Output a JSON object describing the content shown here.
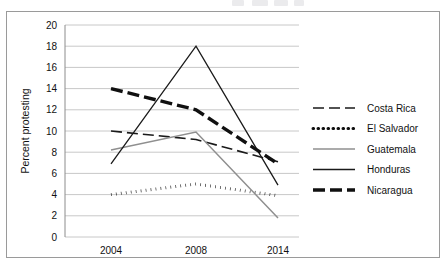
{
  "figure": {
    "border_color": "#9a9a9a",
    "background": "#ffffff"
  },
  "chart_data": {
    "type": "line",
    "title": "",
    "xlabel": "",
    "ylabel": "Percent protesting",
    "x": [
      2004,
      2008,
      2014
    ],
    "xtick_labels": [
      "2004",
      "2008",
      "2014"
    ],
    "ytick_labels": [
      "0",
      "2",
      "4",
      "6",
      "8",
      "10",
      "12",
      "14",
      "16",
      "18",
      "20"
    ],
    "ytick_values": [
      0,
      2,
      4,
      6,
      8,
      10,
      12,
      14,
      16,
      18,
      20
    ],
    "ylim": [
      0,
      20
    ],
    "grid": "horizontal",
    "legend_position": "right",
    "series": [
      {
        "name": "Costa Rica",
        "values": [
          10.0,
          9.2,
          7.1
        ],
        "color": "#1a1a1a",
        "width": 1.6,
        "dash": "11,5",
        "legend_key": "dash-long"
      },
      {
        "name": "El Salvador",
        "values": [
          4.0,
          5.0,
          3.9
        ],
        "color": "#111111",
        "width": 3.0,
        "dash": "0.6,4.4",
        "legend_key": "dotted"
      },
      {
        "name": "Guatemala",
        "values": [
          8.2,
          9.9,
          1.8
        ],
        "color": "#8f8f8f",
        "width": 1.5,
        "dash": "none",
        "legend_key": "solid-gray"
      },
      {
        "name": "Honduras",
        "values": [
          6.9,
          18.0,
          4.9
        ],
        "color": "#1a1a1a",
        "width": 1.3,
        "dash": "none",
        "legend_key": "solid-thin"
      },
      {
        "name": "Nicaragua",
        "values": [
          14.0,
          12.0,
          6.9
        ],
        "color": "#101010",
        "width": 3.4,
        "dash": "12,5",
        "legend_key": "dash-heavy"
      }
    ]
  },
  "legend": {
    "entries": [
      {
        "label": "Costa Rica"
      },
      {
        "label": "El Salvador"
      },
      {
        "label": "Guatemala"
      },
      {
        "label": "Honduras"
      },
      {
        "label": "Nicaragua"
      }
    ]
  }
}
